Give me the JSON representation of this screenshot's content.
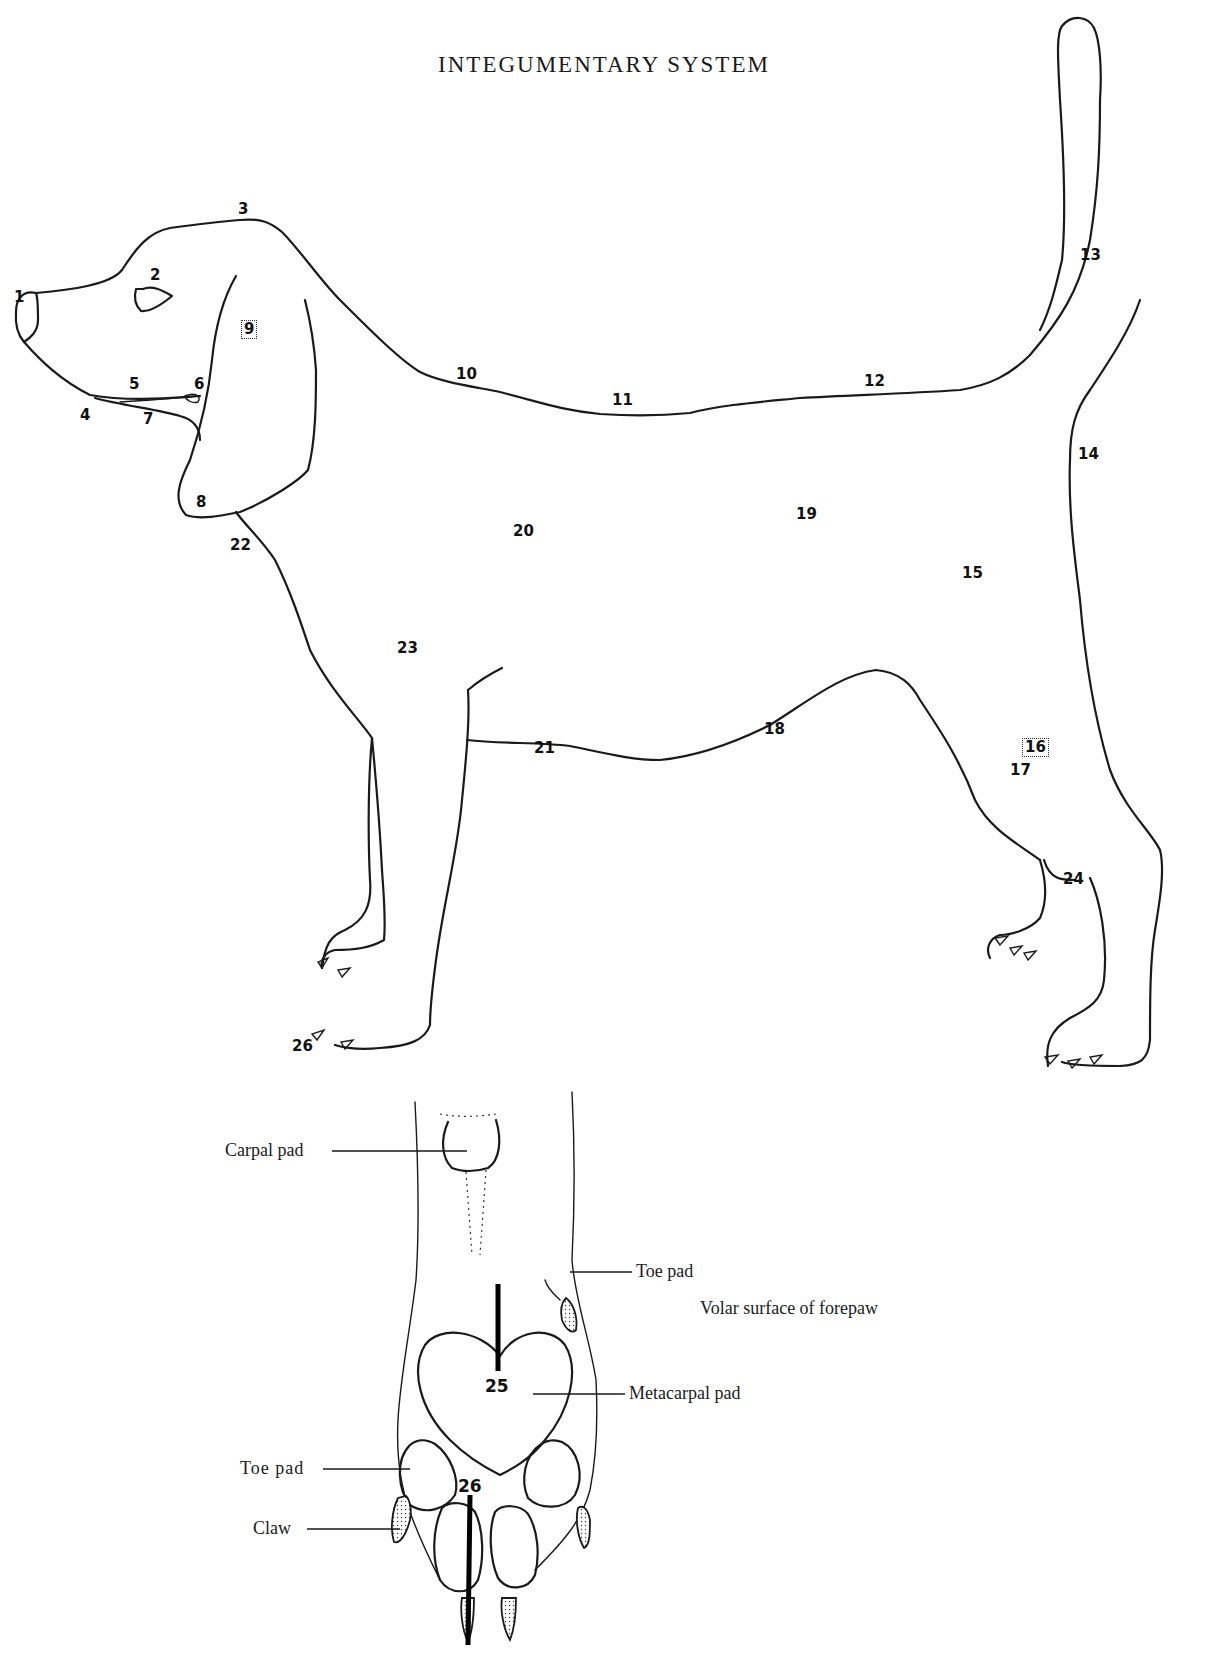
{
  "page": {
    "title": "INTEGUMENTARY SYSTEM",
    "background": "#ffffff",
    "ink_color": "#1a1a1a"
  },
  "lateral_view": {
    "labels": [
      {
        "id": "1",
        "text": "1",
        "x": 16,
        "y": 297,
        "boxed": false
      },
      {
        "id": "2",
        "text": "2",
        "x": 146,
        "y": 273,
        "boxed": false
      },
      {
        "id": "3",
        "text": "3",
        "x": 239,
        "y": 207,
        "boxed": false
      },
      {
        "id": "4",
        "text": "4",
        "x": 81,
        "y": 414,
        "boxed": false
      },
      {
        "id": "5",
        "text": "5",
        "x": 129,
        "y": 383,
        "boxed": false
      },
      {
        "id": "6",
        "text": "6",
        "x": 195,
        "y": 384,
        "boxed": false
      },
      {
        "id": "7",
        "text": "7",
        "x": 143,
        "y": 418,
        "boxed": false
      },
      {
        "id": "8",
        "text": "8",
        "x": 197,
        "y": 501,
        "boxed": false
      },
      {
        "id": "9",
        "text": "9",
        "x": 243,
        "y": 326,
        "boxed": true
      },
      {
        "id": "10",
        "text": "10",
        "x": 456,
        "y": 373,
        "boxed": false
      },
      {
        "id": "11",
        "text": "11",
        "x": 612,
        "y": 399,
        "boxed": false
      },
      {
        "id": "12",
        "text": "12",
        "x": 863,
        "y": 380,
        "boxed": false
      },
      {
        "id": "13",
        "text": "13",
        "x": 1078,
        "y": 254,
        "boxed": false
      },
      {
        "id": "14",
        "text": "14",
        "x": 1077,
        "y": 453,
        "boxed": false
      },
      {
        "id": "15",
        "text": "15",
        "x": 962,
        "y": 572,
        "boxed": false
      },
      {
        "id": "16",
        "text": "16",
        "x": 1024,
        "y": 744,
        "boxed": true
      },
      {
        "id": "17",
        "text": "17",
        "x": 1010,
        "y": 769,
        "boxed": false
      },
      {
        "id": "18",
        "text": "18",
        "x": 764,
        "y": 728,
        "boxed": false
      },
      {
        "id": "19",
        "text": "19",
        "x": 795,
        "y": 513,
        "boxed": false
      },
      {
        "id": "20",
        "text": "20",
        "x": 512,
        "y": 530,
        "boxed": false
      },
      {
        "id": "21",
        "text": "21",
        "x": 534,
        "y": 747,
        "boxed": false
      },
      {
        "id": "22",
        "text": "22",
        "x": 231,
        "y": 544,
        "boxed": false
      },
      {
        "id": "23",
        "text": "23",
        "x": 396,
        "y": 647,
        "boxed": false
      },
      {
        "id": "24",
        "text": "24",
        "x": 1063,
        "y": 878,
        "boxed": false
      },
      {
        "id": "26",
        "text": "26",
        "x": 292,
        "y": 1045,
        "boxed": false
      }
    ]
  },
  "forepaw_view": {
    "title": "Volar surface of forepaw",
    "callouts": [
      {
        "id": "carpal-pad",
        "text": "Carpal pad"
      },
      {
        "id": "toe-pad-upper",
        "text": "Toe pad"
      },
      {
        "id": "metacarpal-pad",
        "text": "Metacarpal pad"
      },
      {
        "id": "toe-pad-lower",
        "text": "Toe pad"
      },
      {
        "id": "claw",
        "text": "Claw"
      }
    ],
    "numbers": [
      {
        "id": "25",
        "text": "25"
      },
      {
        "id": "26",
        "text": "26"
      }
    ]
  }
}
